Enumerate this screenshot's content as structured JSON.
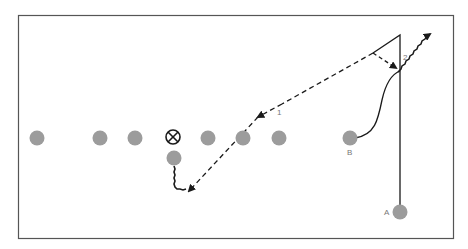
{
  "diagram": {
    "type": "football-play",
    "colors": {
      "player": "#9c9c9c",
      "line": "#1a1a1a",
      "border": "#555555",
      "label": "#777777"
    },
    "line_of_scrimmage_players": [
      {
        "id": "p1",
        "cx": 37,
        "cy": 138
      },
      {
        "id": "p2",
        "cx": 100,
        "cy": 138
      },
      {
        "id": "p3",
        "cx": 135,
        "cy": 138
      },
      {
        "id": "p4",
        "cx": 208,
        "cy": 138
      },
      {
        "id": "p5",
        "cx": 243,
        "cy": 138
      },
      {
        "id": "p6",
        "cx": 279,
        "cy": 138
      }
    ],
    "quarterback": {
      "symbol": "circled-x",
      "cx": 173,
      "cy": 137
    },
    "back": {
      "cx": 174,
      "cy": 158
    },
    "receiver_b": {
      "label": "B",
      "cx": 350,
      "cy": 138
    },
    "receiver_a": {
      "label": "A",
      "cx": 400,
      "cy": 212
    },
    "route_labels": {
      "route_1": "1",
      "route_2": "2"
    }
  }
}
